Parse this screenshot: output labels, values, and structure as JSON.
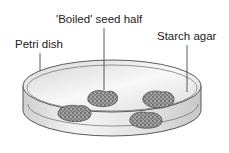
{
  "diagram": {
    "labels": {
      "petri_dish": "Petri dish",
      "boiled_seed_half": "'Boiled' seed half",
      "starch_agar": "Starch agar"
    },
    "colors": {
      "outline": "#333333",
      "dish_fill": "#e8e8e8",
      "seed_fill": "#888888"
    }
  }
}
